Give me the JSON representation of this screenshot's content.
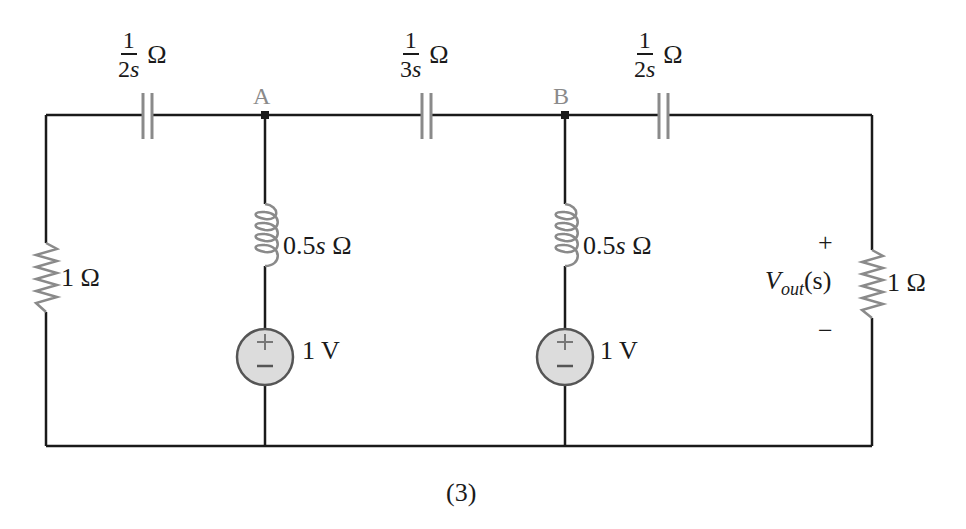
{
  "figure": {
    "caption": "(3)"
  },
  "nodes": {
    "a": {
      "label": "A"
    },
    "b": {
      "label": "B"
    }
  },
  "components": {
    "cap_left": {
      "numerator": "1",
      "denominator_coef": "2",
      "denominator_var": "s",
      "unit": "Ω"
    },
    "cap_mid": {
      "numerator": "1",
      "denominator_coef": "3",
      "denominator_var": "s",
      "unit": "Ω"
    },
    "cap_right": {
      "numerator": "1",
      "denominator_coef": "2",
      "denominator_var": "s",
      "unit": "Ω"
    },
    "res_left": {
      "value": "1 Ω"
    },
    "res_right": {
      "value": "1 Ω"
    },
    "ind_a": {
      "coef": "0.5",
      "var": "s",
      "unit": " Ω"
    },
    "ind_b": {
      "coef": "0.5",
      "var": "s",
      "unit": " Ω"
    },
    "src_a": {
      "value": "1 V",
      "plus": "+",
      "minus": "−"
    },
    "src_b": {
      "value": "1 V",
      "plus": "+",
      "minus": "−"
    }
  },
  "output": {
    "symbol": "V",
    "subscript": "out",
    "arg": "(s)",
    "plus": "+",
    "minus": "−"
  },
  "colors": {
    "wire": "#1a1a1a",
    "component": "#8a8a8a",
    "source_fill": "#dcdcdc"
  }
}
